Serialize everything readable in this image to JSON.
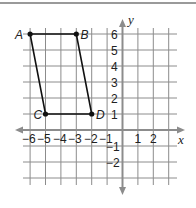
{
  "diagram": {
    "type": "coordinate-plane",
    "axes": {
      "x_label": "x",
      "y_label": "y",
      "x_ticks": [
        "−6",
        "−5",
        "−4",
        "−3",
        "−2",
        "−1",
        "1",
        "2"
      ],
      "y_ticks": [
        "6",
        "5",
        "4",
        "3",
        "2",
        "1",
        "−1",
        "−2"
      ],
      "x_range": [
        -6,
        3
      ],
      "y_range": [
        -3,
        6
      ]
    },
    "points": [
      {
        "name": "A",
        "x": -6,
        "y": 6
      },
      {
        "name": "B",
        "x": -3,
        "y": 6
      },
      {
        "name": "C",
        "x": -5,
        "y": 1
      },
      {
        "name": "D",
        "x": -2,
        "y": 1
      }
    ],
    "shape": {
      "type": "parallelogram",
      "vertices": [
        "A",
        "B",
        "D",
        "C"
      ]
    },
    "colors": {
      "grid": "#8c8c8c",
      "axis": "#8c8c8c",
      "shape": "#111111"
    }
  }
}
